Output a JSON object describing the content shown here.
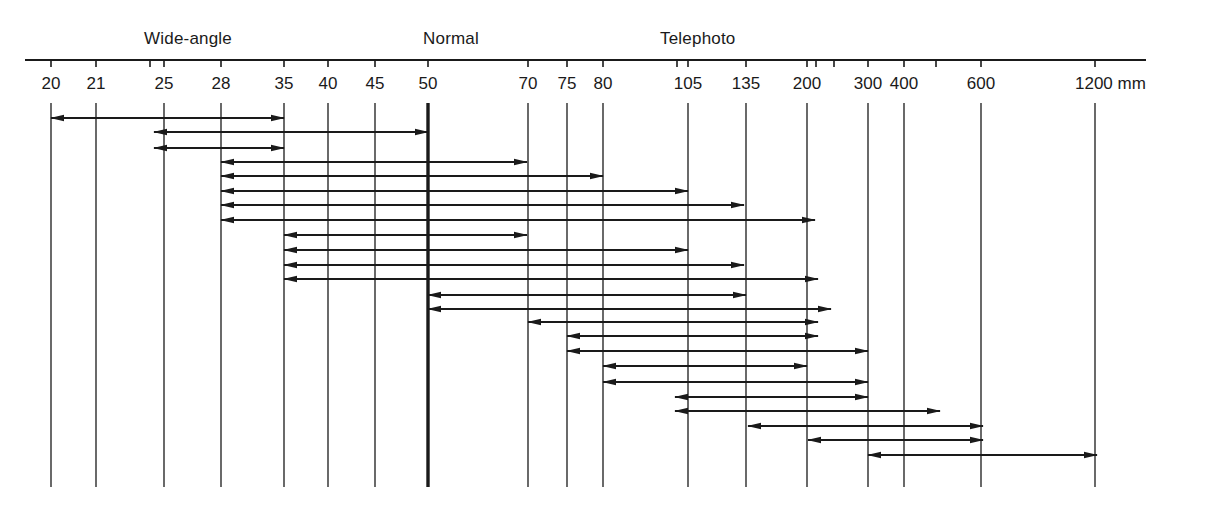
{
  "categories": [
    {
      "label": "Wide-angle",
      "x": 144
    },
    {
      "label": "Normal",
      "x": 423
    },
    {
      "label": "Telephoto",
      "x": 660
    }
  ],
  "unit": "mm",
  "axis": {
    "y": 60,
    "x_start": 25,
    "x_end": 1146,
    "tick_len": 7
  },
  "ticks": [
    {
      "mm": 20,
      "x": 51,
      "label": "20",
      "line": true
    },
    {
      "mm": 21,
      "x": 96,
      "label": "21",
      "line": true
    },
    {
      "mm": 24,
      "x": 150,
      "label": "",
      "line": false
    },
    {
      "mm": 25,
      "x": 164,
      "label": "25",
      "line": true
    },
    {
      "mm": 28,
      "x": 221,
      "label": "28",
      "line": true
    },
    {
      "mm": 35,
      "x": 284,
      "label": "35",
      "line": true
    },
    {
      "mm": 40,
      "x": 328,
      "label": "40",
      "line": true
    },
    {
      "mm": 45,
      "x": 375,
      "label": "45",
      "line": true
    },
    {
      "mm": 50,
      "x": 428,
      "label": "50",
      "line": true,
      "thick": true
    },
    {
      "mm": 70,
      "x": 528,
      "label": "70",
      "line": true
    },
    {
      "mm": 75,
      "x": 567,
      "label": "75",
      "line": true
    },
    {
      "mm": 80,
      "x": 603,
      "label": "80",
      "line": true
    },
    {
      "mm": 100,
      "x": 677,
      "label": "",
      "line": false
    },
    {
      "mm": 105,
      "x": 688,
      "label": "105",
      "line": true
    },
    {
      "mm": 135,
      "x": 746,
      "label": "135",
      "line": true
    },
    {
      "mm": 200,
      "x": 807,
      "label": "200",
      "line": true
    },
    {
      "mm": 210,
      "x": 816,
      "label": "",
      "line": false
    },
    {
      "mm": 250,
      "x": 834,
      "label": "",
      "line": false
    },
    {
      "mm": 300,
      "x": 868,
      "label": "300",
      "line": true
    },
    {
      "mm": 400,
      "x": 904,
      "label": "400",
      "line": true
    },
    {
      "mm": 500,
      "x": 936,
      "label": "",
      "line": false
    },
    {
      "mm": 600,
      "x": 981,
      "label": "600",
      "line": true
    },
    {
      "mm": 1200,
      "x": 1095,
      "label": "1200 mm",
      "line": true
    }
  ],
  "vertical_lines": {
    "y_top": 103,
    "y_bottom": 487
  },
  "chart_data": {
    "type": "range-diagram",
    "title": "",
    "xlabel": "Focal length (mm)",
    "scale": "logarithmic",
    "tick_labels": [
      "20",
      "21",
      "25",
      "28",
      "35",
      "40",
      "45",
      "50",
      "70",
      "75",
      "80",
      "105",
      "135",
      "200",
      "300",
      "400",
      "600",
      "1200 mm"
    ],
    "category_labels": [
      "Wide-angle",
      "Normal",
      "Telephoto"
    ],
    "ranges": [
      {
        "from": 20,
        "to": 35,
        "y": 118,
        "x1": 51,
        "x2": 284
      },
      {
        "from": 25,
        "to": 50,
        "y": 132,
        "x1": 154,
        "x2": 428
      },
      {
        "from": 25,
        "to": 35,
        "y": 148,
        "x1": 154,
        "x2": 284
      },
      {
        "from": 28,
        "to": 70,
        "y": 162,
        "x1": 221,
        "x2": 527
      },
      {
        "from": 28,
        "to": 80,
        "y": 176,
        "x1": 221,
        "x2": 603
      },
      {
        "from": 28,
        "to": 105,
        "y": 191,
        "x1": 221,
        "x2": 688
      },
      {
        "from": 28,
        "to": 135,
        "y": 205,
        "x1": 221,
        "x2": 744
      },
      {
        "from": 28,
        "to": 200,
        "y": 220,
        "x1": 221,
        "x2": 815
      },
      {
        "from": 35,
        "to": 70,
        "y": 235,
        "x1": 284,
        "x2": 527
      },
      {
        "from": 35,
        "to": 105,
        "y": 250,
        "x1": 284,
        "x2": 688
      },
      {
        "from": 35,
        "to": 135,
        "y": 265,
        "x1": 284,
        "x2": 744
      },
      {
        "from": 35,
        "to": 200,
        "y": 279,
        "x1": 284,
        "x2": 818
      },
      {
        "from": 50,
        "to": 135,
        "y": 295,
        "x1": 428,
        "x2": 746
      },
      {
        "from": 50,
        "to": 210,
        "y": 309,
        "x1": 428,
        "x2": 831
      },
      {
        "from": 70,
        "to": 200,
        "y": 322,
        "x1": 528,
        "x2": 818
      },
      {
        "from": 75,
        "to": 200,
        "y": 336,
        "x1": 567,
        "x2": 818
      },
      {
        "from": 75,
        "to": 300,
        "y": 351,
        "x1": 567,
        "x2": 868
      },
      {
        "from": 80,
        "to": 200,
        "y": 366,
        "x1": 603,
        "x2": 807
      },
      {
        "from": 80,
        "to": 300,
        "y": 382,
        "x1": 603,
        "x2": 868
      },
      {
        "from": 105,
        "to": 300,
        "y": 397,
        "x1": 675,
        "x2": 868
      },
      {
        "from": 100,
        "to": 500,
        "y": 411,
        "x1": 675,
        "x2": 940
      },
      {
        "from": 135,
        "to": 600,
        "y": 426,
        "x1": 748,
        "x2": 983
      },
      {
        "from": 200,
        "to": 600,
        "y": 440,
        "x1": 808,
        "x2": 983
      },
      {
        "from": 300,
        "to": 1200,
        "y": 455,
        "x1": 868,
        "x2": 1097
      }
    ],
    "grid": true,
    "legend": "none"
  },
  "colors": {
    "ink": "#1a1a1a",
    "background": "#ffffff"
  }
}
